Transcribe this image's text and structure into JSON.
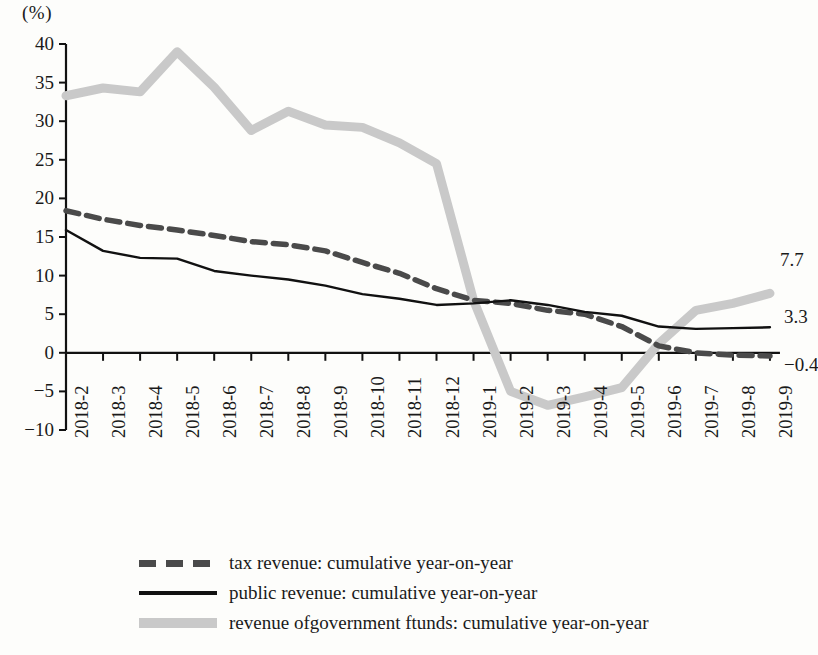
{
  "chart_data": {
    "type": "line",
    "title": "",
    "xlabel": "",
    "ylabel": "(%)",
    "ylim": [
      -10,
      40
    ],
    "yticks": [
      40,
      35,
      30,
      25,
      20,
      15,
      10,
      5,
      0,
      -5,
      -10
    ],
    "ytick_labels": [
      "40",
      "35",
      "30",
      "25",
      "20",
      "15",
      "10",
      "5",
      "0",
      "−5",
      "−10"
    ],
    "grid": false,
    "legend_position": "bottom",
    "categories": [
      "2018-2",
      "2018-3",
      "2018-4",
      "2018-5",
      "2018-6",
      "2018-7",
      "2018-8",
      "2018-9",
      "2018-10",
      "2018-11",
      "2018-12",
      "2019-1",
      "2019-2",
      "2019-3",
      "2019-4",
      "2019-5",
      "2019-6",
      "2019-7",
      "2019-8",
      "2019-9"
    ],
    "series": [
      {
        "name": "tax revenue: cumulative year-on-year",
        "style": "dashed",
        "color": "#4a4a4a",
        "values": [
          18.4,
          17.3,
          16.5,
          15.9,
          15.2,
          14.4,
          14.0,
          13.2,
          11.7,
          10.3,
          8.3,
          6.8,
          6.4,
          5.5,
          5.0,
          3.4,
          0.9,
          0.0,
          -0.3,
          -0.4
        ],
        "end_label": "−0.4"
      },
      {
        "name": "public revenue: cumulative year-on-year",
        "style": "solid",
        "color": "#111111",
        "values": [
          15.9,
          13.2,
          12.3,
          12.2,
          10.6,
          10.0,
          9.5,
          8.7,
          7.6,
          7.0,
          6.2,
          6.4,
          6.8,
          6.2,
          5.3,
          4.8,
          3.4,
          3.1,
          3.2,
          3.3
        ],
        "end_label": "3.3"
      },
      {
        "name": "revenue ofgovernment ftunds: cumulative year-on-year",
        "style": "thick",
        "color": "#c9c9c9",
        "values": [
          33.3,
          34.3,
          33.8,
          39.0,
          34.4,
          28.8,
          31.3,
          29.5,
          29.2,
          27.2,
          24.5,
          6.8,
          -5.0,
          -6.8,
          -5.7,
          -4.5,
          1.2,
          5.5,
          6.4,
          7.7
        ],
        "end_label": "7.7"
      }
    ]
  },
  "legend": {
    "items": [
      "tax revenue: cumulative year-on-year",
      "public revenue: cumulative year-on-year",
      "revenue ofgovernment ftunds: cumulative year-on-year"
    ]
  }
}
